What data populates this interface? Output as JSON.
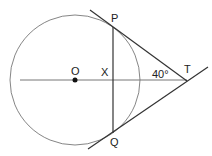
{
  "diagram": {
    "type": "geometry",
    "colors": {
      "background": "#ffffff",
      "stroke": "#333333",
      "circle_stroke": "#666666",
      "axis_stroke": "#777777",
      "text": "#222222"
    },
    "labels": {
      "P": "P",
      "Q": "Q",
      "O": "O",
      "X": "X",
      "T": "T",
      "angle": "40°"
    },
    "geometry": {
      "circle": {
        "cx": 75,
        "cy": 80,
        "r": 65
      },
      "centre_O": [
        75,
        80
      ],
      "point_T": [
        187,
        80
      ],
      "point_P": [
        113,
        27
      ],
      "point_Q": [
        113,
        133
      ],
      "point_X": [
        113,
        80
      ],
      "angle_PTQ_half": "40°"
    }
  }
}
